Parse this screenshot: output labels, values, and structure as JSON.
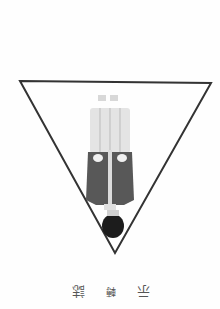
{
  "page": {
    "orientation": "rotated-180",
    "background": "#fefefe"
  },
  "illustration": {
    "shape": "inverted-triangle",
    "stroke_color": "#333333",
    "figure": {
      "description": "person standing, shown upside-down",
      "trousers_color": "#e6e6e6",
      "jacket_color": "#555555",
      "hair_color": "#1a1a1a"
    }
  },
  "caption": {
    "chars": [
      "示",
      "轉",
      "誌"
    ]
  }
}
